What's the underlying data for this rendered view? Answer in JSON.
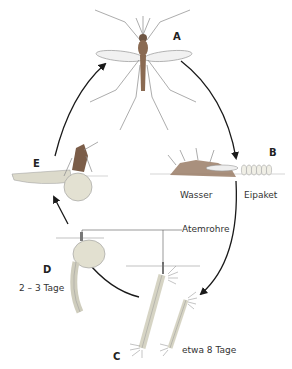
{
  "diagram": {
    "stages": [
      {
        "id": "A",
        "letter": "A",
        "description": "adult mosquito"
      },
      {
        "id": "B",
        "letter": "B",
        "description": "egg laying"
      },
      {
        "id": "C",
        "letter": "C",
        "description": "larvae"
      },
      {
        "id": "D",
        "letter": "D",
        "description": "pupa"
      },
      {
        "id": "E",
        "letter": "E",
        "description": "emerging adult"
      }
    ],
    "labels": {
      "water": "Wasser",
      "egg_packet": "Eipaket",
      "breathing_tubes": "Atemrohre",
      "larva_duration": "etwa 8 Tage",
      "pupa_duration": "2 – 3 Tage"
    },
    "colors": {
      "arrow": "#1a1a1a",
      "body": "#8a6a52",
      "larva": "#d8d6c6",
      "line": "#555555"
    }
  }
}
